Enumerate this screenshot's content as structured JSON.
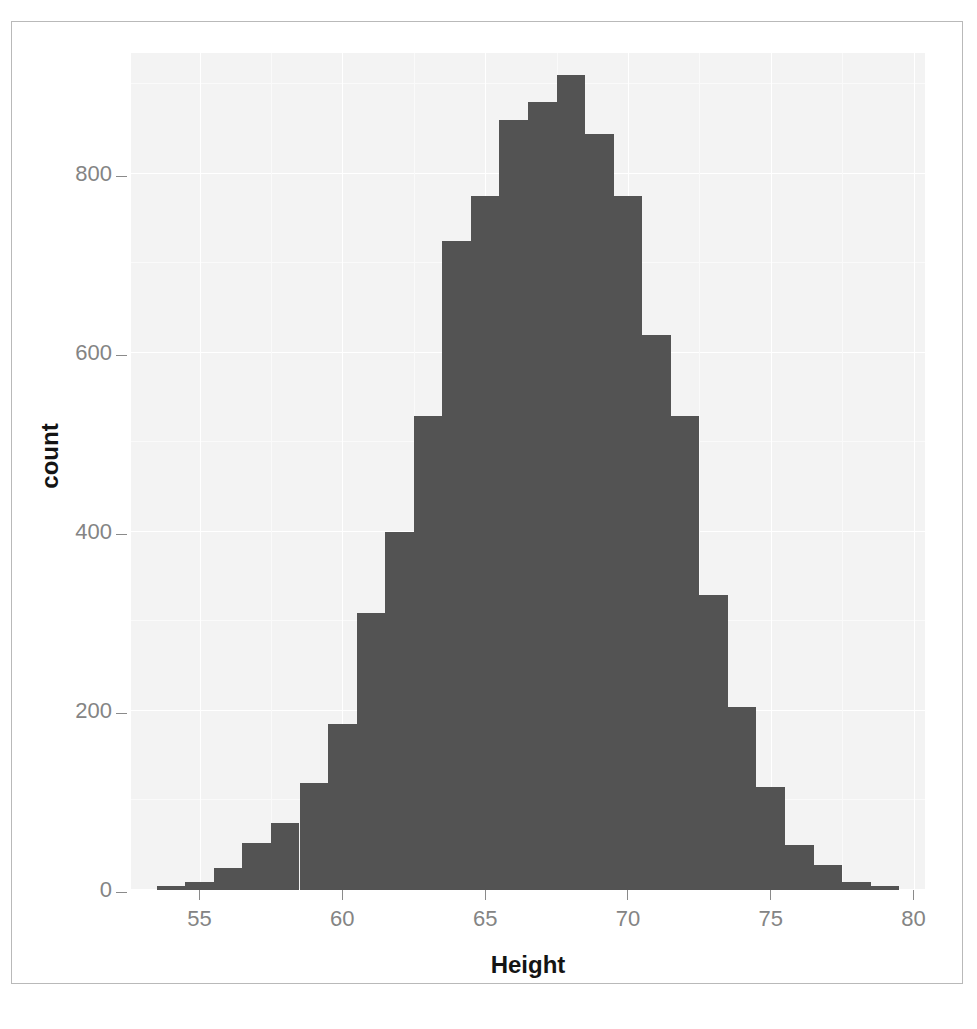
{
  "figure": {
    "background_color": "#ffffff",
    "panel_color": "#f3f3f3",
    "bar_color": "#535353",
    "axis_text_color": "#848484",
    "axis_title_color": "#141414",
    "border_color": "#b9b9b9"
  },
  "axes": {
    "x_title": "Height",
    "y_title": "count",
    "x_ticks": [
      "55",
      "60",
      "65",
      "70",
      "75",
      "80"
    ],
    "y_ticks": [
      "0",
      "200",
      "400",
      "600",
      "800"
    ]
  },
  "chart_data": {
    "type": "bar",
    "title": "",
    "subtitle": "",
    "xlabel": "Height",
    "ylabel": "count",
    "xlim": [
      52.6,
      80.4
    ],
    "ylim": [
      0,
      935
    ],
    "grid": true,
    "legend": "none",
    "bin_width": 1,
    "annotations": [],
    "categories": [
      "54",
      "55",
      "56",
      "57",
      "58",
      "59",
      "60",
      "61",
      "62",
      "63",
      "64",
      "65",
      "66",
      "67",
      "68",
      "69",
      "70",
      "71",
      "72",
      "73",
      "74",
      "75",
      "76",
      "77",
      "78",
      "79"
    ],
    "x": [
      54,
      55,
      56,
      57,
      58,
      59,
      60,
      61,
      62,
      63,
      64,
      65,
      66,
      67,
      68,
      69,
      70,
      71,
      72,
      73,
      74,
      75,
      76,
      77,
      78,
      79
    ],
    "values": [
      4,
      9,
      25,
      52,
      75,
      120,
      185,
      310,
      400,
      530,
      725,
      775,
      860,
      880,
      910,
      845,
      775,
      620,
      530,
      330,
      205,
      115,
      50,
      28,
      9,
      4
    ]
  }
}
